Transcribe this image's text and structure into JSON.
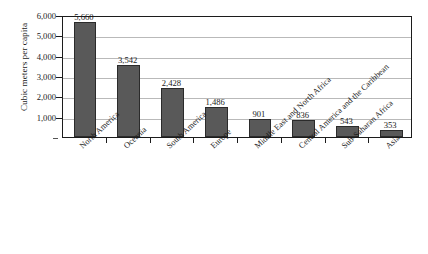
{
  "chart_data": {
    "type": "bar",
    "title": "",
    "subtitle": "",
    "xlabel": "",
    "ylabel": "Cubic meters per capita",
    "ylim": [
      0,
      6000
    ],
    "grid": true,
    "legend": false,
    "legend_position": "none",
    "bar_color": "#595959",
    "bar_edge_color": "#2b2b2b",
    "gridline_color": "#b9b9b9",
    "axis_color": "#1c1c1c",
    "text_color": "#1a1a1a",
    "yticks": [
      {
        "value": 0,
        "label": ""
      },
      {
        "value": 1000,
        "label": "1,000"
      },
      {
        "value": 2000,
        "label": "2,000"
      },
      {
        "value": 3000,
        "label": "3,000"
      },
      {
        "value": 4000,
        "label": "4,000"
      },
      {
        "value": 5000,
        "label": "5,000"
      },
      {
        "value": 6000,
        "label": "6,000"
      }
    ],
    "categories": [
      "North America",
      "Oceania",
      "South America",
      "Europe",
      "Middle East and North Africa",
      "Central America and the Caribbean",
      "Sub-Saharan Africa",
      "Asia"
    ],
    "values": [
      5660,
      3542,
      2428,
      1486,
      901,
      836,
      543,
      353
    ],
    "data_labels": [
      "5,660",
      "3,542",
      "2,428",
      "1,486",
      "901",
      "836",
      "543",
      "353"
    ]
  }
}
